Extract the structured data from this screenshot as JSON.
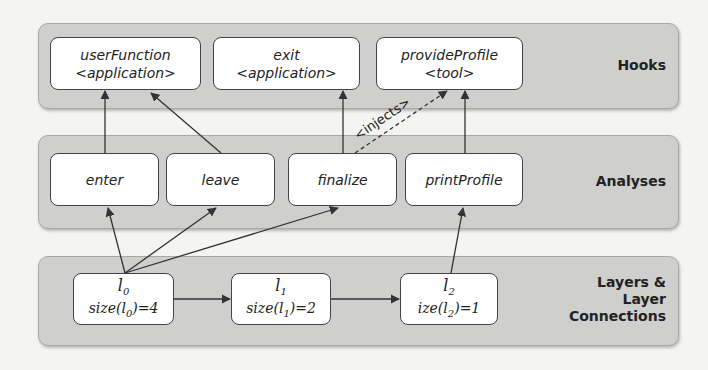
{
  "groups": {
    "hooks": {
      "label": "Hooks"
    },
    "analyses": {
      "label": "Analyses"
    },
    "layers": {
      "label_line1": "Layers &",
      "label_line2": "Layer",
      "label_line3": "Connections"
    }
  },
  "hooks": [
    {
      "name": "userFunction",
      "kind": "<application>"
    },
    {
      "name": "exit",
      "kind": "<application>"
    },
    {
      "name": "provideProfile",
      "kind": "<tool>"
    }
  ],
  "analyses": [
    {
      "name": "enter"
    },
    {
      "name": "leave"
    },
    {
      "name": "finalize"
    },
    {
      "name": "printProfile"
    }
  ],
  "layers": [
    {
      "name": "l",
      "sub": "0",
      "size_prefix": "size(l",
      "size_sub": "0",
      "size_suffix": ")=4"
    },
    {
      "name": "l",
      "sub": "1",
      "size_prefix": "size(l",
      "size_sub": "1",
      "size_suffix": ")=2"
    },
    {
      "name": "l",
      "sub": "2",
      "size_prefix": "ize(l",
      "size_sub": "2",
      "size_suffix": ")=1"
    }
  ],
  "edges": {
    "injects_label": "<injects>"
  },
  "colors": {
    "group_fill": "#cfcfcd",
    "node_fill": "#ffffff",
    "line": "#333333"
  }
}
